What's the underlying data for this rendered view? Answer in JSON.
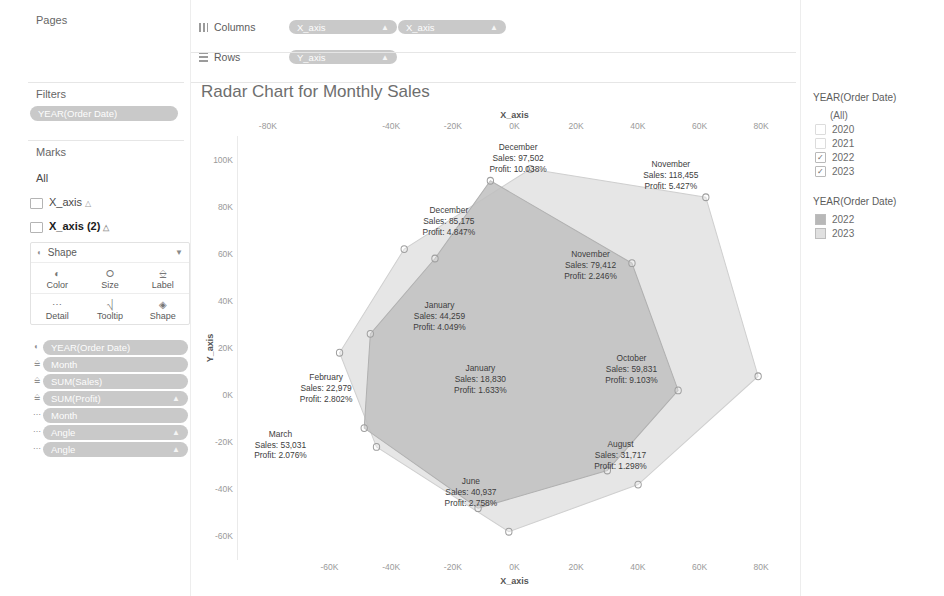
{
  "left_panel": {
    "pages_title": "Pages",
    "filters_title": "Filters",
    "filter_pills": [
      {
        "label": "YEAR(Order Date)"
      }
    ],
    "marks_title": "Marks",
    "marks_tabs": [
      {
        "label": "All",
        "selected": false,
        "has_icon": false
      },
      {
        "label": "X_axis",
        "selected": false,
        "has_icon": true
      },
      {
        "label": "X_axis (2)",
        "selected": true,
        "has_icon": true
      }
    ],
    "shape_selector": "Shape",
    "mark_buttons": [
      {
        "label": "Color",
        "icon": "color-icon"
      },
      {
        "label": "Size",
        "icon": "size-icon"
      },
      {
        "label": "Label",
        "icon": "label-icon"
      },
      {
        "label": "Detail",
        "icon": "detail-icon"
      },
      {
        "label": "Tooltip",
        "icon": "tooltip-icon"
      },
      {
        "label": "Shape",
        "icon": "shape-icon"
      }
    ],
    "mark_pills": [
      {
        "label": "YEAR(Order Date)",
        "caret": "",
        "role": "color"
      },
      {
        "label": "Month",
        "caret": "",
        "role": "label"
      },
      {
        "label": "SUM(Sales)",
        "caret": "",
        "role": "label"
      },
      {
        "label": "SUM(Profit)",
        "caret": "▲",
        "role": "label"
      },
      {
        "label": "Month",
        "caret": "",
        "role": "detail"
      },
      {
        "label": "Angle",
        "caret": "▲",
        "role": "detail"
      },
      {
        "label": "Angle",
        "caret": "▲",
        "role": "detail"
      }
    ]
  },
  "shelves": {
    "columns_label": "Columns",
    "rows_label": "Rows",
    "columns_pills": [
      {
        "label": "X_axis",
        "caret": "▲"
      },
      {
        "label": "X_axis",
        "caret": "▲"
      }
    ],
    "rows_pills": [
      {
        "label": "Y_axis",
        "caret": "▲"
      }
    ]
  },
  "right_panel": {
    "filter_card": {
      "title": "YEAR(Order Date)",
      "items": [
        {
          "label": "(All)",
          "checked": false,
          "blank": true
        },
        {
          "label": "2020",
          "checked": false,
          "blank": false
        },
        {
          "label": "2021",
          "checked": false,
          "blank": false
        },
        {
          "label": "2022",
          "checked": true,
          "blank": false
        },
        {
          "label": "2023",
          "checked": true,
          "blank": false
        }
      ]
    },
    "color_legend": {
      "title": "YEAR(Order Date)",
      "items": [
        {
          "label": "2022",
          "color": "#b8b8b8"
        },
        {
          "label": "2023",
          "color": "#e0e0e0"
        }
      ]
    }
  },
  "chart_data": {
    "type": "scatter",
    "title": "Radar Chart for Monthly Sales",
    "xlabel": "X_axis",
    "ylabel": "Y_axis",
    "xlabel_top": "X_axis",
    "xlim": [
      -90000,
      90000
    ],
    "ylim": [
      -70000,
      110000
    ],
    "grid": false,
    "legend_position": "right",
    "top_axis_ticks": [
      "-80K",
      "-40K",
      "-20K",
      "0K",
      "20K",
      "40K",
      "60K",
      "80K"
    ],
    "top_axis_values": [
      -80000,
      -40000,
      -20000,
      0,
      20000,
      40000,
      60000,
      80000
    ],
    "bottom_axis_ticks": [
      "-60K",
      "-40K",
      "-20K",
      "0K",
      "20K",
      "40K",
      "60K",
      "80K"
    ],
    "bottom_axis_values": [
      -60000,
      -40000,
      -20000,
      0,
      20000,
      40000,
      60000,
      80000
    ],
    "y_axis_ticks": [
      "100K",
      "80K",
      "60K",
      "40K",
      "20K",
      "0K",
      "-20K",
      "-40K",
      "-60K"
    ],
    "y_axis_values": [
      100000,
      80000,
      60000,
      40000,
      20000,
      0,
      -20000,
      -40000,
      -60000
    ],
    "series": [
      {
        "name": "2023",
        "color": "#e2e2e2",
        "stroke": "#cfcfcf",
        "points": [
          {
            "x": 5000,
            "y": 96000
          },
          {
            "x": 62000,
            "y": 84000
          },
          {
            "x": 79000,
            "y": 8000
          },
          {
            "x": 40000,
            "y": -38000
          },
          {
            "x": -2000,
            "y": -58000
          },
          {
            "x": -45000,
            "y": -22000
          },
          {
            "x": -57000,
            "y": 18000
          },
          {
            "x": -36000,
            "y": 62000
          }
        ]
      },
      {
        "name": "2022",
        "color": "#bfbfbf",
        "stroke": "#b0b0b0",
        "points": [
          {
            "x": -8000,
            "y": 91000
          },
          {
            "x": 38000,
            "y": 56000
          },
          {
            "x": 53000,
            "y": 2000
          },
          {
            "x": 30000,
            "y": -32000
          },
          {
            "x": -12000,
            "y": -48000
          },
          {
            "x": -49000,
            "y": -14000
          },
          {
            "x": -47000,
            "y": 26000
          },
          {
            "x": -26000,
            "y": 58000
          }
        ]
      }
    ],
    "annotations": [
      {
        "month": "December",
        "sales": "97,502",
        "profit": "10.038%",
        "x": 422,
        "y": 173,
        "series": "2023"
      },
      {
        "month": "November",
        "sales": "118,455",
        "profit": "5.427%",
        "x": 519,
        "y": 186,
        "series": "2023"
      },
      {
        "month": "December",
        "sales": "85,175",
        "profit": "4.847%",
        "x": 378,
        "y": 222,
        "series": "2022"
      },
      {
        "month": "November",
        "sales": "79,412",
        "profit": "2.246%",
        "x": 468,
        "y": 256,
        "series": "2022"
      },
      {
        "month": "January",
        "sales": "44,259",
        "profit": "4.049%",
        "x": 372,
        "y": 296,
        "series": "2022"
      },
      {
        "month": "October",
        "sales": "59,831",
        "profit": "9.103%",
        "x": 494,
        "y": 337,
        "series": "2023"
      },
      {
        "month": "January",
        "sales": "18,830",
        "profit": "1.633%",
        "x": 398,
        "y": 345,
        "series": "2022"
      },
      {
        "month": "February",
        "sales": "22,979",
        "profit": "2.802%",
        "x": 300,
        "y": 352,
        "series": "2023"
      },
      {
        "month": "March",
        "sales": "53,031",
        "profit": "2.076%",
        "x": 271,
        "y": 396,
        "series": "2022"
      },
      {
        "month": "August",
        "sales": "31,717",
        "profit": "1.298%",
        "x": 487,
        "y": 404,
        "series": "2023"
      },
      {
        "month": "June",
        "sales": "40,937",
        "profit": "2.758%",
        "x": 392,
        "y": 433,
        "series": "2022"
      }
    ]
  }
}
